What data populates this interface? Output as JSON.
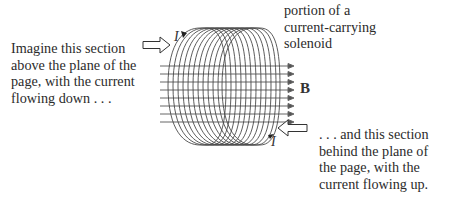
{
  "captions": {
    "left": {
      "lines": [
        "Imagine this section",
        "above the plane of the",
        "page, with the current",
        "flowing down . . ."
      ]
    },
    "top": {
      "lines": [
        "portion of a",
        "current-carrying",
        "solenoid"
      ]
    },
    "right": {
      "lines": [
        ". . . and this section",
        "behind the plane of",
        "the page, with the",
        "current flowing up."
      ]
    }
  },
  "labels": {
    "field": "B",
    "current_top": "I",
    "current_bottom": "I"
  },
  "diagram": {
    "subject": "current-carrying solenoid",
    "loop_count": 12,
    "field_line_count": 8,
    "line_color": "#555555",
    "icons": [
      "hollow-arrow-right",
      "hollow-arrow-left",
      "current-arrow-down",
      "current-arrow-up"
    ]
  }
}
